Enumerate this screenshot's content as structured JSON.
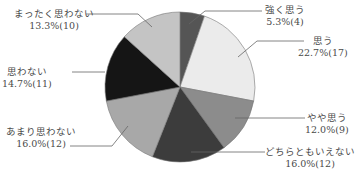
{
  "chart_data": {
    "type": "pie",
    "title": "",
    "start_angle": "top",
    "direction": "clockwise",
    "slices": [
      {
        "label": "強く思う",
        "percent": 5.3,
        "count": 4,
        "color": "#555555"
      },
      {
        "label": "思う",
        "percent": 22.7,
        "count": 17,
        "color": "#ebebeb"
      },
      {
        "label": "やや思う",
        "percent": 12.0,
        "count": 9,
        "color": "#8c8c8c"
      },
      {
        "label": "どちらともいえない",
        "percent": 16.0,
        "count": 12,
        "color": "#3c3c3c"
      },
      {
        "label": "あまり思わない",
        "percent": 16.0,
        "count": 12,
        "color": "#a8a8a8"
      },
      {
        "label": "思わない",
        "percent": 14.7,
        "count": 11,
        "color": "#151515"
      },
      {
        "label": "まったく思わない",
        "percent": 13.3,
        "count": 10,
        "color": "#c4c4c4"
      }
    ]
  },
  "labels": [
    {
      "name": "強く思う",
      "value": "5.3%(4)"
    },
    {
      "name": "思う",
      "value": "22.7%(17)"
    },
    {
      "name": "やや思う",
      "value": "12.0%(9)"
    },
    {
      "name": "どちらともいえない",
      "value": "16.0%(12)"
    },
    {
      "name": "あまり思わない",
      "value": "16.0%(12)"
    },
    {
      "name": "思わない",
      "value": "14.7%(11)"
    },
    {
      "name": "まったく思わない",
      "value": "13.3%(10)"
    }
  ]
}
